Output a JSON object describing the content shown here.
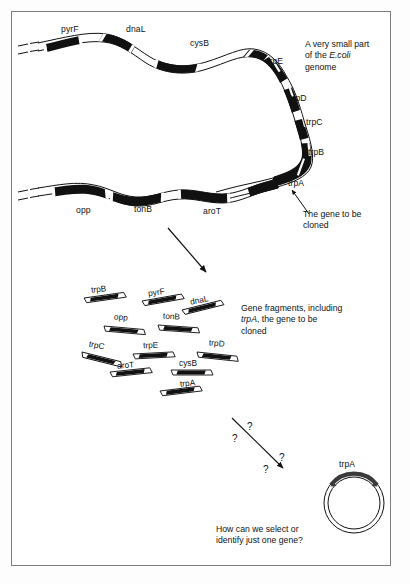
{
  "figure": {
    "stroke_color": "#000000",
    "gene_fill": "#111111",
    "frame_color": "#7d7d7d"
  },
  "genome": {
    "top_strand_genes": [
      {
        "name": "pyrF",
        "label_x": 61,
        "label_y": 29
      },
      {
        "name": "dnaL",
        "label_x": 126,
        "label_y": 29
      },
      {
        "name": "cysB",
        "label_x": 190,
        "label_y": 42
      },
      {
        "name": "trpE",
        "label_x": 268,
        "label_y": 61
      },
      {
        "name": "trpD",
        "label_x": 289,
        "label_y": 99
      },
      {
        "name": "trpC",
        "label_x": 305,
        "label_y": 122
      },
      {
        "name": "trpB",
        "label_x": 307,
        "label_y": 152
      },
      {
        "name": "trpA",
        "label_x": 289,
        "label_y": 183
      }
    ],
    "bottom_strand_genes": [
      {
        "name": "opp",
        "label_x": 76,
        "label_y": 208
      },
      {
        "name": "tonB",
        "label_x": 134,
        "label_y": 207
      },
      {
        "name": "aroT",
        "label_x": 204,
        "label_y": 209
      }
    ]
  },
  "callouts": {
    "genome_note_line1": "A very small part",
    "genome_note_line2_prefix": "of the ",
    "genome_note_line2_italic": "E.coli",
    "genome_note_line3": "genome",
    "cloned_gene_line1": "The gene to be",
    "cloned_gene_line2": "cloned",
    "fragments_note_line1": "Gene fragments, including",
    "fragments_note_line2_italic": "trpA",
    "fragments_note_line2_rest": ", the gene to be",
    "fragments_note_line3": "cloned",
    "question_line1": "How can we select or",
    "question_line2": "identify just one gene?"
  },
  "fragments": [
    {
      "name": "trpB",
      "label_x": 91,
      "label_y": 284,
      "x": 84,
      "y": 298,
      "angle": -8
    },
    {
      "name": "pyrF",
      "label_x": 148,
      "label_y": 287,
      "x": 142,
      "y": 301,
      "angle": -10
    },
    {
      "name": "dnaL",
      "label_x": 190,
      "label_y": 295,
      "x": 182,
      "y": 310,
      "angle": -14
    },
    {
      "name": "opp",
      "label_x": 114,
      "label_y": 312,
      "x": 104,
      "y": 326,
      "angle": 5
    },
    {
      "name": "tonB",
      "label_x": 163,
      "label_y": 311,
      "x": 158,
      "y": 325,
      "angle": 4
    },
    {
      "name": "trpC",
      "label_x": 89,
      "label_y": 340,
      "x": 82,
      "y": 352,
      "angle": 14
    },
    {
      "name": "trpE",
      "label_x": 143,
      "label_y": 340,
      "x": 133,
      "y": 354,
      "angle": -3
    },
    {
      "name": "trpD",
      "label_x": 209,
      "label_y": 338,
      "x": 197,
      "y": 352,
      "angle": 6
    },
    {
      "name": "aroT",
      "label_x": 117,
      "label_y": 360,
      "x": 110,
      "y": 372,
      "angle": -6
    },
    {
      "name": "cysB",
      "label_x": 179,
      "label_y": 358,
      "x": 171,
      "y": 370,
      "angle": 0
    },
    {
      "name": "trpA",
      "label_x": 180,
      "label_y": 378,
      "x": 160,
      "y": 391,
      "angle": -7
    }
  ],
  "question_marks": [
    {
      "mark": "?",
      "x": 247,
      "y": 421
    },
    {
      "mark": "?",
      "x": 232,
      "y": 433
    },
    {
      "mark": "?",
      "x": 279,
      "y": 452
    },
    {
      "mark": "?",
      "x": 263,
      "y": 464
    }
  ],
  "plasmid": {
    "label": "trpA",
    "label_x": 339,
    "label_y": 464,
    "center_x": 354,
    "center_y": 503,
    "radius_outer": 30,
    "radius_inner": 26
  }
}
